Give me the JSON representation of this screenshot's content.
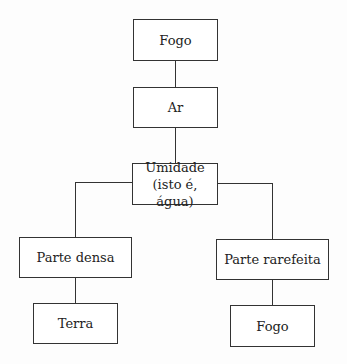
{
  "diagram": {
    "nodes": [
      {
        "id": "fogo-top",
        "label": "Fogo"
      },
      {
        "id": "ar",
        "label": "Ar"
      },
      {
        "id": "umidade",
        "label_line1": "Umidade",
        "label_line2": "(isto é, água)"
      },
      {
        "id": "parte-densa",
        "label": "Parte densa"
      },
      {
        "id": "parte-rarefeita",
        "label": "Parte rarefeita"
      },
      {
        "id": "terra",
        "label": "Terra"
      },
      {
        "id": "fogo-bottom",
        "label": "Fogo"
      }
    ],
    "edges": [
      [
        "fogo-top",
        "ar"
      ],
      [
        "ar",
        "umidade"
      ],
      [
        "umidade",
        "parte-densa"
      ],
      [
        "umidade",
        "parte-rarefeita"
      ],
      [
        "parte-densa",
        "terra"
      ],
      [
        "parte-rarefeita",
        "fogo-bottom"
      ]
    ]
  }
}
